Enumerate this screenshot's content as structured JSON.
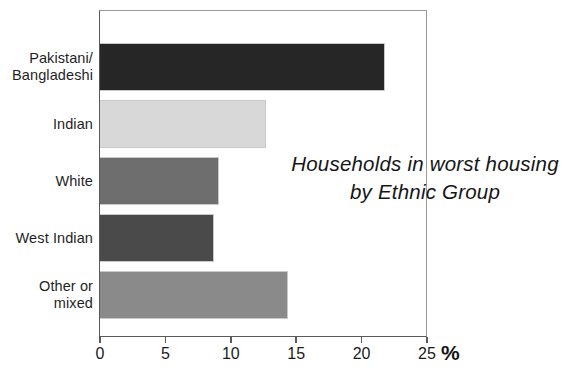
{
  "chart_data": {
    "type": "bar",
    "orientation": "horizontal",
    "title": "Households in worst housing by Ethnic Group",
    "title_lines": [
      "Households in worst housing",
      "by  Ethnic Group"
    ],
    "xlabel": "%",
    "ylabel": "",
    "xlim": [
      0,
      25
    ],
    "xticks": [
      0,
      5,
      10,
      15,
      20,
      25
    ],
    "xtick_labels": [
      "0",
      "5",
      "10",
      "15",
      "20",
      "25"
    ],
    "grid": false,
    "legend": false,
    "categories": [
      "Pakistani/ Bangladeshi",
      "Indian",
      "White",
      "West Indian",
      "Other or mixed"
    ],
    "category_lines": [
      [
        "Pakistani/",
        "Bangladeshi"
      ],
      [
        "Indian"
      ],
      [
        "White"
      ],
      [
        "West Indian"
      ],
      [
        "Other or",
        "mixed"
      ]
    ],
    "values": [
      21.8,
      12.7,
      9.1,
      8.7,
      14.4
    ],
    "bar_colors": [
      "#262626",
      "#d8d8d8",
      "#6e6e6e",
      "#4a4a4a",
      "#8a8a8a"
    ]
  },
  "axis": {
    "unit_symbol": "%"
  },
  "colors": {
    "background": "#ffffff",
    "axis_line": "#5a5a5a",
    "frame_line": "#9a9a9a",
    "text": "#1a1a1a",
    "bar_outline": "#c9c9c9"
  }
}
